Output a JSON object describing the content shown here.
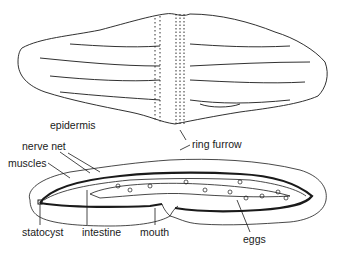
{
  "figure": {
    "upper_view": "external dorsal view",
    "lower_view": "cross section"
  },
  "labels": {
    "epidermis": "epidermis",
    "nerve_net": "nerve net",
    "muscles": "muscles",
    "ring_furrow": "ring furrow",
    "statocyst": "statocyst",
    "intestine": "intestine",
    "mouth": "mouth",
    "eggs": "eggs"
  },
  "colors": {
    "line": "#1a1a1a",
    "background": "#ffffff"
  }
}
